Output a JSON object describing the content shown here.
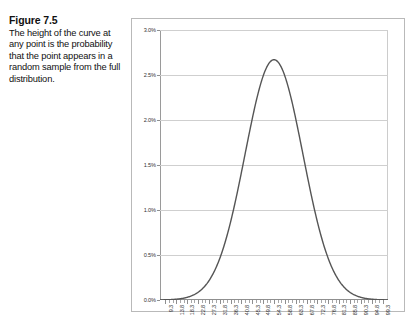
{
  "caption": {
    "title": "Figure 7.5",
    "body": "The height of the curve at any point is the probability that the point appears in a random sample from the full distribution."
  },
  "chart_data": {
    "type": "line",
    "title": "",
    "xlabel": "",
    "ylabel": "",
    "grid": true,
    "legend": false,
    "curve_color": "#555555",
    "gridline_color": "#cfcfcf",
    "axis_color": "#8f8f8f",
    "xlim": [
      7.05,
      101.55
    ],
    "ylim": [
      0,
      3.0
    ],
    "ytick_values": [
      0.0,
      0.5,
      1.0,
      1.5,
      2.0,
      2.5,
      3.0
    ],
    "ytick_labels": [
      "0.0%",
      "0.5%",
      "1.0%",
      "1.5%",
      "2.0%",
      "2.5%",
      "3.0%"
    ],
    "xtick_labels": [
      "9.3",
      "13.8",
      "18.3",
      "22.8",
      "27.3",
      "31.8",
      "36.3",
      "40.8",
      "45.3",
      "49.8",
      "54.3",
      "58.8",
      "63.3",
      "67.8",
      "72.3",
      "76.8",
      "81.3",
      "85.8",
      "90.3",
      "94.8",
      "99.3"
    ],
    "x": [
      9.3,
      13.8,
      18.3,
      22.8,
      27.3,
      31.8,
      36.3,
      40.8,
      45.3,
      49.8,
      54.3,
      58.8,
      63.3,
      67.8,
      72.3,
      76.8,
      81.3,
      85.8,
      90.3,
      94.8,
      99.3
    ],
    "y": [
      0.002,
      0.009,
      0.032,
      0.099,
      0.262,
      0.596,
      1.163,
      1.951,
      2.514,
      2.663,
      2.663,
      2.514,
      1.951,
      1.163,
      0.596,
      0.262,
      0.099,
      0.032,
      0.009,
      0.002,
      0.0
    ],
    "peak_value": 2.67,
    "peak_x": 54.3,
    "distribution": "normal",
    "mean": 54.3,
    "stdev": 12.0
  }
}
